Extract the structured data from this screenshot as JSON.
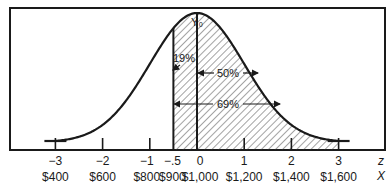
{
  "chart_data": {
    "type": "area",
    "title": "",
    "distribution": {
      "mean_x": 1000,
      "sd_x": 200,
      "mean_z": 0,
      "sd_z": 1
    },
    "z_range": [
      -3,
      3
    ],
    "shaded_from_z": -0.5,
    "z_ticks": [
      {
        "z": -3,
        "z_label": "−3",
        "x_label": "$400"
      },
      {
        "z": -2,
        "z_label": "−2",
        "x_label": "$600"
      },
      {
        "z": -1,
        "z_label": "−1",
        "x_label": "$800"
      },
      {
        "z": -0.5,
        "z_label": "−.5",
        "x_label": "$900"
      },
      {
        "z": 0,
        "z_label": "0",
        "x_label": "$1,000"
      },
      {
        "z": 1,
        "z_label": "1",
        "x_label": "$1,200"
      },
      {
        "z": 2,
        "z_label": "2",
        "x_label": "$1,400"
      },
      {
        "z": 3,
        "z_label": "3",
        "x_label": "$1,600"
      }
    ],
    "axis_names": {
      "z": "z",
      "x": "X"
    },
    "peak_label": "Y₀",
    "annotations": [
      {
        "label": "19%",
        "from_z": -0.5,
        "to_z": 0,
        "meaning": "area between z=-0.5 and mean"
      },
      {
        "label": "50%",
        "from_z": 0,
        "to_z": 3,
        "meaning": "area to the right of mean"
      },
      {
        "label": "69%",
        "from_z": -0.5,
        "to_z": 3,
        "meaning": "total shaded area"
      }
    ],
    "colors": {
      "ink": "#1a1a1a",
      "background": "#ffffff"
    }
  }
}
